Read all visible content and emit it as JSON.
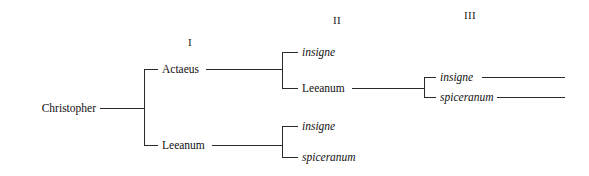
{
  "figure": {
    "type": "taxonomic-tree",
    "orientation": "left-to-right",
    "background_color": "#ffffff",
    "line_color": "#2a2a2a",
    "text_color": "#111111"
  },
  "level_headers": [
    {
      "label": "I",
      "x": 190,
      "y": 42
    },
    {
      "label": "II",
      "x": 337,
      "y": 20
    },
    {
      "label": "III",
      "x": 470,
      "y": 15
    }
  ],
  "nodes": {
    "root": {
      "label": "Christopher",
      "style": "roman",
      "x": 96,
      "y": 108,
      "align": "right"
    },
    "level1": [
      {
        "label": "Actaeus",
        "style": "roman",
        "x": 162,
        "y": 69
      },
      {
        "label": "Leeanum",
        "style": "roman",
        "x": 162,
        "y": 145
      }
    ],
    "level2_from_actaeus": [
      {
        "label": "insigne",
        "style": "italic",
        "x": 302,
        "y": 52
      },
      {
        "label": "Leeanum",
        "style": "roman",
        "x": 302,
        "y": 88
      }
    ],
    "level2_from_leeanum": [
      {
        "label": "insigne",
        "style": "italic",
        "x": 302,
        "y": 126
      },
      {
        "label": "spiceranum",
        "style": "italic",
        "x": 302,
        "y": 157
      }
    ],
    "level3_from_leeanum": [
      {
        "label": "insigne",
        "style": "italic",
        "x": 440,
        "y": 77
      },
      {
        "label": "spiceranum",
        "style": "italic",
        "x": 440,
        "y": 97
      }
    ]
  },
  "connectors": {
    "root_stem": {
      "x": 100,
      "y": 108,
      "width": 44
    },
    "root_bracket": {
      "x": 144,
      "top": 69,
      "bottom": 145
    },
    "root_to_actaeus": {
      "x": 144,
      "y": 69,
      "width": 14
    },
    "root_to_leeanum": {
      "x": 144,
      "y": 145,
      "width": 14
    },
    "actaeus_stem": {
      "x": 206,
      "y": 69,
      "width": 76
    },
    "actaeus_bracket": {
      "x": 282,
      "top": 52,
      "bottom": 88
    },
    "actaeus_to_insigne": {
      "x": 282,
      "y": 52,
      "width": 16
    },
    "actaeus_to_leeanum": {
      "x": 282,
      "y": 88,
      "width": 16
    },
    "leeanum1_stem": {
      "x": 212,
      "y": 145,
      "width": 70
    },
    "leeanum1_bracket": {
      "x": 282,
      "top": 126,
      "bottom": 157
    },
    "leeanum1_to_insigne": {
      "x": 282,
      "y": 126,
      "width": 16
    },
    "leeanum1_to_spiceranum": {
      "x": 282,
      "y": 157,
      "width": 16
    },
    "leeanum2_stem": {
      "x": 352,
      "y": 88,
      "width": 72
    },
    "leeanum2_bracket": {
      "x": 424,
      "top": 77,
      "bottom": 97
    },
    "leeanum2_to_insigne": {
      "x": 424,
      "y": 77,
      "width": 12
    },
    "leeanum2_to_spiceranum": {
      "x": 424,
      "y": 97,
      "width": 12
    },
    "insigne3_tail": {
      "x": 482,
      "y": 77,
      "width": 83
    },
    "spiceranum3_tail": {
      "x": 497,
      "y": 97,
      "width": 68
    }
  }
}
